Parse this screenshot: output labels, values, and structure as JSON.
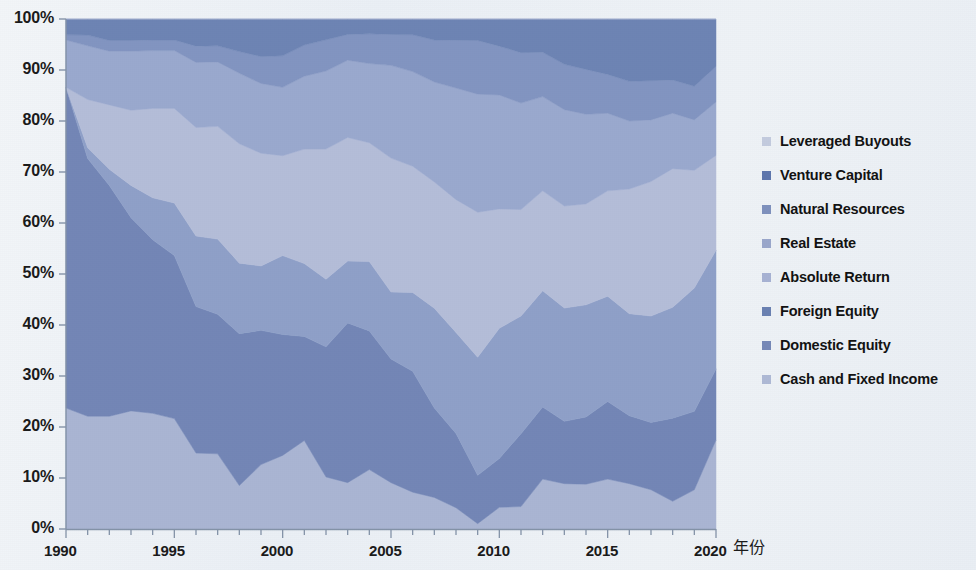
{
  "chart_data": {
    "type": "area",
    "title": "",
    "subtitle": "",
    "xlabel": "年份",
    "ylabel": "",
    "stacked": true,
    "normalized_percent": true,
    "grid": false,
    "legend_position": "right",
    "xlim": [
      1990,
      2020
    ],
    "ylim": [
      0,
      100
    ],
    "y_tick_labels": [
      "100%",
      "90%",
      "80%",
      "70%",
      "60%",
      "50%",
      "40%",
      "30%",
      "20%",
      "10%",
      "0%"
    ],
    "y_tick_values": [
      100,
      90,
      80,
      70,
      60,
      50,
      40,
      30,
      20,
      10,
      0
    ],
    "x_tick_labels": [
      "1990",
      "1995",
      "2000",
      "2005",
      "2010",
      "2015",
      "2020"
    ],
    "x_tick_values": [
      1990,
      1995,
      2000,
      2005,
      2010,
      2015,
      2020
    ],
    "x_minor_tick_step": 1,
    "x": [
      1990,
      1991,
      1992,
      1993,
      1994,
      1995,
      1996,
      1997,
      1998,
      1999,
      2000,
      2001,
      2002,
      2003,
      2004,
      2005,
      2006,
      2007,
      2008,
      2009,
      2010,
      2011,
      2012,
      2013,
      2014,
      2015,
      2016,
      2017,
      2018,
      2019,
      2020
    ],
    "series": [
      {
        "name": "Cash and Fixed Income",
        "color": "#aab5d3",
        "stack_order": 1,
        "values": [
          23,
          21,
          21,
          22,
          22,
          21,
          14,
          14,
          8,
          12,
          14,
          17,
          10,
          9,
          12,
          9,
          7,
          6,
          4,
          1,
          4,
          4,
          9,
          8,
          8,
          9,
          8,
          7,
          5,
          7,
          15
        ]
      },
      {
        "name": "Domestic Equity",
        "color": "#7386b6",
        "stack_order": 2,
        "values": [
          61,
          48,
          43,
          36,
          33,
          31,
          27,
          26,
          28,
          25,
          23,
          20,
          25,
          31,
          28,
          24,
          23,
          17,
          14,
          9,
          9,
          13,
          13,
          11,
          12,
          14,
          12,
          12,
          15,
          14,
          12
        ]
      },
      {
        "name": "Foreign Equity",
        "color": "#8fa0c8",
        "stack_order": 3,
        "values": [
          0,
          2,
          3,
          6,
          8,
          10,
          13,
          14,
          13,
          12,
          15,
          14,
          13,
          12,
          14,
          13,
          15,
          19,
          19,
          22,
          24,
          21,
          21,
          20,
          20,
          19,
          18,
          19,
          20,
          22,
          20
        ]
      },
      {
        "name": "Absolute Return",
        "color": "#b4bdd8",
        "stack_order": 4,
        "values": [
          0,
          9,
          12,
          14,
          17,
          18,
          20,
          21,
          22,
          21,
          19,
          22,
          25,
          24,
          24,
          26,
          24,
          24,
          25,
          27,
          22,
          19,
          18,
          18,
          18,
          19,
          22,
          24,
          25,
          21,
          16
        ]
      },
      {
        "name": "Real Estate",
        "color": "#9aa9ce",
        "stack_order": 5,
        "values": [
          9,
          10,
          10,
          11,
          11,
          11,
          12,
          12,
          13,
          13,
          13,
          14,
          15,
          15,
          16,
          18,
          18,
          19,
          21,
          22,
          21,
          19,
          17,
          17,
          16,
          14,
          12,
          11,
          10,
          9,
          9
        ]
      },
      {
        "name": "Natural Resources",
        "color": "#8295c1",
        "stack_order": 6,
        "values": [
          1,
          2,
          2,
          2,
          2,
          2,
          3,
          3,
          4,
          5,
          6,
          6,
          6,
          5,
          6,
          6,
          7,
          8,
          9,
          10,
          9,
          9,
          8,
          8,
          8,
          7,
          7,
          7,
          6,
          6,
          6
        ]
      },
      {
        "name": "Venture Capital",
        "color": "#6d84b4",
        "stack_order": 7,
        "values": [
          3,
          3,
          4,
          4,
          4,
          4,
          5,
          5,
          6,
          7,
          7,
          5,
          4,
          3,
          3,
          3,
          3,
          4,
          4,
          4,
          5,
          6,
          6,
          8,
          9,
          10,
          11,
          11,
          11,
          12,
          8
        ]
      },
      {
        "name": "Leveraged Buyouts",
        "color": "#b9c2da",
        "stack_order": 8,
        "values": [
          0,
          0,
          0,
          0,
          0,
          0,
          0,
          0,
          0,
          0,
          0,
          0,
          0,
          0,
          0,
          0,
          0,
          0,
          0,
          0,
          0,
          0,
          0,
          0,
          0,
          0,
          0,
          0,
          0,
          0,
          0
        ]
      }
    ]
  },
  "legend": {
    "items": [
      {
        "label": "Leveraged Buyouts",
        "color": "#c3cbde"
      },
      {
        "label": "Venture Capital",
        "color": "#5d76ad"
      },
      {
        "label": "Natural Resources",
        "color": "#7e91bd"
      },
      {
        "label": "Real Estate",
        "color": "#9aa7cb"
      },
      {
        "label": "Absolute Return",
        "color": "#a7b2d3"
      },
      {
        "label": "Foreign Equity",
        "color": "#6a81b2"
      },
      {
        "label": "Domestic Equity",
        "color": "#7588b7"
      },
      {
        "label": "Cash and Fixed Income",
        "color": "#aeb9d5"
      }
    ]
  },
  "axes": {
    "x_title": "年份",
    "y_labels": [
      "100%",
      "90%",
      "80%",
      "70%",
      "60%",
      "50%",
      "40%",
      "30%",
      "20%",
      "10%",
      "0%"
    ],
    "x_labels": [
      "1990",
      "1995",
      "2000",
      "2005",
      "2010",
      "2015",
      "2020"
    ]
  },
  "colors": {
    "background": "#eef2f6",
    "plot_background": "#e8edf4",
    "axis": "#7b8aa0",
    "text": "#1a1a1a",
    "band_dark": "#6d84b4",
    "band_mid": "#7d90bd",
    "band_light": "#b4bdd8"
  }
}
